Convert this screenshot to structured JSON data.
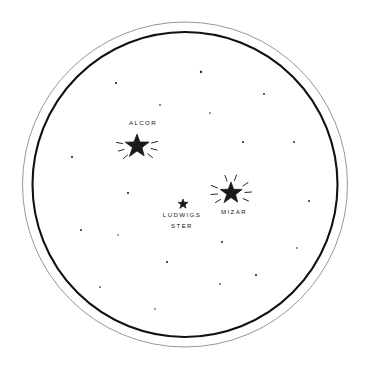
{
  "view": {
    "title": "Star Field Eyepiece View",
    "background_color": "#ffffff",
    "ink_color": "#1a1a1a",
    "outer_ring": {
      "cx": 185,
      "cy": 184.5,
      "r": 162.5,
      "stroke_width": 0.7,
      "color": "#6a6a6a"
    },
    "inner_ring": {
      "cx": 185,
      "cy": 184.5,
      "r": 152.5,
      "stroke_width": 2.1,
      "color": "#111111"
    }
  },
  "labels": {
    "alcor": "ALCOR",
    "mizar": "MIZAR",
    "ludwigs_line1": "LUDWIGS",
    "ludwigs_line2": "STER"
  },
  "bright_stars": [
    {
      "name": "alcor",
      "label": "ALCOR",
      "cx": 137,
      "cy": 146,
      "radius": 12.5,
      "rays": true,
      "label_x": 143,
      "label_y": 118,
      "label_position": "above"
    },
    {
      "name": "mizar",
      "label": "MIZAR",
      "cx": 231,
      "cy": 193,
      "radius": 11.5,
      "rays": true,
      "label_x": 234,
      "label_y": 207,
      "label_position": "below"
    },
    {
      "name": "ludwigs-ster",
      "label": "LUDWIGS STER",
      "cx": 183,
      "cy": 204,
      "radius": 5.2,
      "rays": false,
      "label_x": 182,
      "label_y": 210,
      "label_position": "below"
    }
  ],
  "field_stars": [
    {
      "cx": 116,
      "cy": 83,
      "r": 1.05
    },
    {
      "cx": 160,
      "cy": 105,
      "r": 0.85
    },
    {
      "cx": 201,
      "cy": 72,
      "r": 1.15
    },
    {
      "cx": 264,
      "cy": 94,
      "r": 0.95
    },
    {
      "cx": 210,
      "cy": 113,
      "r": 0.8
    },
    {
      "cx": 243,
      "cy": 142,
      "r": 1.0
    },
    {
      "cx": 294,
      "cy": 142,
      "r": 0.9
    },
    {
      "cx": 72,
      "cy": 157,
      "r": 1.0
    },
    {
      "cx": 128,
      "cy": 193,
      "r": 1.0
    },
    {
      "cx": 81,
      "cy": 230,
      "r": 0.95
    },
    {
      "cx": 118,
      "cy": 235,
      "r": 0.7
    },
    {
      "cx": 309,
      "cy": 201,
      "r": 0.95
    },
    {
      "cx": 222,
      "cy": 242,
      "r": 0.95
    },
    {
      "cx": 297,
      "cy": 248,
      "r": 0.8
    },
    {
      "cx": 167,
      "cy": 262,
      "r": 1.0
    },
    {
      "cx": 256,
      "cy": 275,
      "r": 1.0
    },
    {
      "cx": 220,
      "cy": 284,
      "r": 0.85
    },
    {
      "cx": 100,
      "cy": 287,
      "r": 0.85
    },
    {
      "cx": 155,
      "cy": 309,
      "r": 0.75
    }
  ],
  "ray_sets": {
    "alcor": [
      {
        "x1": -20.5,
        "y1": -3.5,
        "x2": -14.5,
        "y2": -2.5
      },
      {
        "x1": -18.5,
        "y1": 5.0,
        "x2": -13.0,
        "y2": 3.5
      },
      {
        "x1": -13.5,
        "y1": 12.5,
        "x2": -9.5,
        "y2": 9.0
      },
      {
        "x1": 20.5,
        "y1": -4.5,
        "x2": 14.5,
        "y2": -3.0
      },
      {
        "x1": 20.0,
        "y1": 4.0,
        "x2": 14.0,
        "y2": 2.5
      },
      {
        "x1": 15.5,
        "y1": 11.5,
        "x2": 11.0,
        "y2": 8.0
      }
    ],
    "mizar": [
      {
        "x1": -19.5,
        "y1": -7.5,
        "x2": -13.5,
        "y2": -5.0
      },
      {
        "x1": -20.0,
        "y1": 1.5,
        "x2": -13.5,
        "y2": 1.0
      },
      {
        "x1": -15.5,
        "y1": 9.5,
        "x2": -10.5,
        "y2": 6.5
      },
      {
        "x1": -6.0,
        "y1": -17.5,
        "x2": -4.0,
        "y2": -12.0
      },
      {
        "x1": 5.5,
        "y1": -18.0,
        "x2": 3.5,
        "y2": -12.5
      },
      {
        "x1": 17.0,
        "y1": -10.5,
        "x2": 12.0,
        "y2": -7.0
      },
      {
        "x1": 20.5,
        "y1": -1.0,
        "x2": 14.0,
        "y2": -0.5
      },
      {
        "x1": 17.5,
        "y1": 8.0,
        "x2": 12.0,
        "y2": 5.5
      }
    ]
  }
}
